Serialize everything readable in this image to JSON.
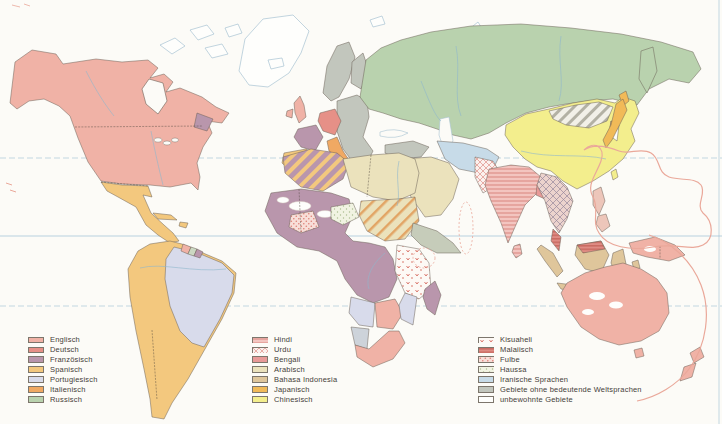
{
  "colors": {
    "english": "#f0b2a6",
    "german": "#e69087",
    "french": "#b996ac",
    "spanish": "#f3c87e",
    "portuguese": "#d8dbeb",
    "italian": "#f0a963",
    "russian": "#b9d2ae",
    "hindi_base": "#f3c5c0",
    "hindi_stripe": "#dc8b85",
    "urdu_base": "#fbf1ee",
    "urdu_stripe": "#e29a92",
    "bengali": "#e89a98",
    "arabic": "#ebe2bc",
    "bahasa": "#dfc69b",
    "japanese": "#f1ba58",
    "chinese": "#f3ee8d",
    "kiswahili_base": "#fdf9f5",
    "kiswahili_mark": "#d5695e",
    "malay_base": "#df8c84",
    "malay_stripe": "#bf5a50",
    "fulbe_base": "#f8ded8",
    "fulbe_dot": "#dd7f76",
    "haussa_base": "#f1f3e2",
    "haussa_dot": "#a9bc8e",
    "iranian": "#c7dbe8",
    "no_world_language": "#c2c6bd",
    "uninhabited": "#fefefc",
    "suriname": "#ccd8c2",
    "philippines": "#edc6ba",
    "horn": "#c6ccba",
    "namibia": "#cdd3da",
    "mongolia_base": "#f2f0e8",
    "mongolia_stripe": "#b3b1a4",
    "indochina_base": "#ecd3cd",
    "indochina_stripe": "#96879b",
    "sahel_stripe": "#e2a565",
    "ocean": "#fcfbf7",
    "coast": "#a8c3d2",
    "river": "#8fb7cc",
    "border": "#6b6157",
    "graticule": "#9cc0d4",
    "pacific_outline": "#eaa89a"
  },
  "legend": {
    "columns": [
      {
        "items": [
          {
            "id": "englisch",
            "label": "Englisch"
          },
          {
            "id": "deutsch",
            "label": "Deutsch"
          },
          {
            "id": "franzoesisch",
            "label": "Französisch"
          },
          {
            "id": "spanisch",
            "label": "Spanisch"
          },
          {
            "id": "portugiesisch",
            "label": "Portugiesisch"
          },
          {
            "id": "italienisch",
            "label": "Italienisch"
          },
          {
            "id": "russisch",
            "label": "Russisch"
          }
        ]
      },
      {
        "items": [
          {
            "id": "hindi",
            "label": "Hindi"
          },
          {
            "id": "urdu",
            "label": "Urdu"
          },
          {
            "id": "bengali",
            "label": "Bengali"
          },
          {
            "id": "arabisch",
            "label": "Arabisch"
          },
          {
            "id": "bahasa-indonesia",
            "label": "Bahasa Indonesia"
          },
          {
            "id": "japanisch",
            "label": "Japanisch"
          },
          {
            "id": "chinesisch",
            "label": "Chinesisch"
          }
        ]
      },
      {
        "items": [
          {
            "id": "kisuaheli",
            "label": "Kisuaheli"
          },
          {
            "id": "malaiisch",
            "label": "Malaiisch"
          },
          {
            "id": "fulbe",
            "label": "Fulbe"
          },
          {
            "id": "haussa",
            "label": "Haussa"
          },
          {
            "id": "iranische-sprachen",
            "label": "Iranische Sprachen"
          },
          {
            "id": "gebiete-ohne-weltsprachen",
            "label": "Gebiete ohne bedeutende Weltsprachen"
          },
          {
            "id": "unbewohnte-gebiete",
            "label": "unbewohnte Gebiete"
          }
        ]
      }
    ]
  }
}
